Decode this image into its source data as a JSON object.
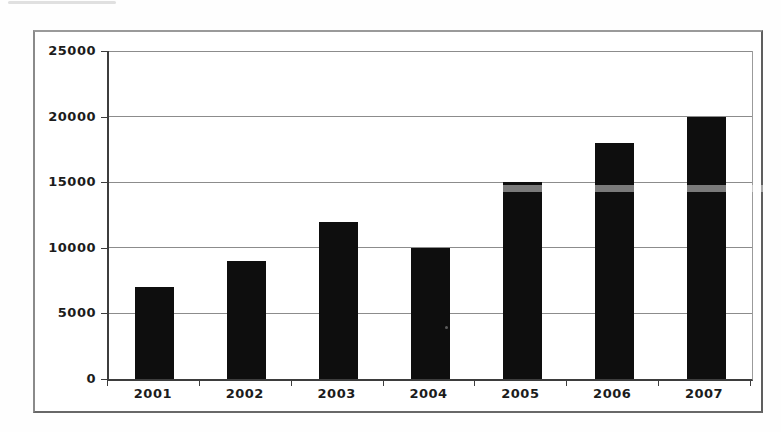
{
  "chart_data": {
    "type": "bar",
    "categories": [
      "2001",
      "2002",
      "2003",
      "2004",
      "2005",
      "2006",
      "2007"
    ],
    "values": [
      7000,
      9000,
      12000,
      10000,
      15000,
      18000,
      20000
    ],
    "title": "",
    "xlabel": "",
    "ylabel": "",
    "ylim": [
      0,
      25000
    ],
    "yticks": [
      0,
      5000,
      10000,
      15000,
      20000,
      25000
    ],
    "grid": true,
    "legend_position": "none",
    "bar_color": "#0e0e0e",
    "gridline_color": "#8c8c8c",
    "axis_color": "#3d3d3d",
    "frame_color": "#7d7d7d",
    "plot_background": "#ffffff",
    "page_background": "#fefefe"
  }
}
